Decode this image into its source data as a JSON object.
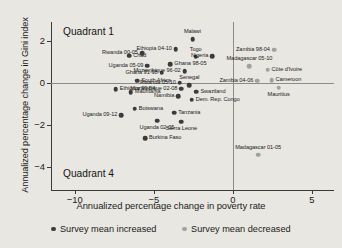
{
  "chart_data": {
    "type": "scatter",
    "title": "",
    "xlabel": "Annualized percentage change in poverty rate",
    "ylabel": "Annualized percentage change in Gini index",
    "xlim": [
      -11.5,
      6.4
    ],
    "ylim": [
      -5.1,
      2.9
    ],
    "xticks": [
      -10,
      -5,
      0,
      5
    ],
    "xtick_labels": [
      "−10",
      "−5",
      "0",
      "5"
    ],
    "yticks": [
      2,
      0,
      -2,
      -4
    ],
    "ytick_labels": [
      "2",
      "0",
      "−2",
      "−4"
    ],
    "grid": false,
    "zero_lines": {
      "x": 0,
      "y": 0
    },
    "annotations": [
      {
        "text": "Quadrant 1",
        "position": "upper-left"
      },
      {
        "text": "Quadrant 4",
        "position": "lower-left"
      }
    ],
    "legend": {
      "position": "below-axes",
      "entries": [
        {
          "label": "Survey mean increased",
          "color": "#3b3b3b",
          "key": "inc"
        },
        {
          "label": "Survey mean decreased",
          "color": "#a3a19d",
          "key": "dec"
        }
      ]
    },
    "series": [
      {
        "name": "Survey mean increased",
        "key": "inc",
        "color": "#3b3b3b",
        "points": [
          {
            "label": "Chad",
            "x": -6.55,
            "y": 1.3,
            "lblpos": "e"
          },
          {
            "label": "Rwanda 00-05",
            "x": -5.75,
            "y": 1.42,
            "lblpos": "w"
          },
          {
            "label": "Ethiopia 04-10",
            "x": -3.6,
            "y": 1.6,
            "lblpos": "w"
          },
          {
            "label": "Malawi",
            "x": -2.55,
            "y": 2.08,
            "lblpos": "n"
          },
          {
            "label": "Togo",
            "x": -2.35,
            "y": 1.24,
            "lblpos": "n"
          },
          {
            "label": "Nigeria",
            "x": -1.3,
            "y": 1.28,
            "lblpos": "w"
          },
          {
            "label": "Uganda 05-09",
            "x": -5.4,
            "y": 0.82,
            "lblpos": "w"
          },
          {
            "label": "Ghana 98-05",
            "x": -3.95,
            "y": 0.88,
            "lblpos": "e"
          },
          {
            "label": "Ghana 91-98",
            "x": -4.5,
            "y": 0.48,
            "lblpos": "w"
          },
          {
            "label": "Mozambique 96-02",
            "x": -3.05,
            "y": 0.55,
            "lblpos": "w"
          },
          {
            "label": "South Africa",
            "x": -6.05,
            "y": 0.1,
            "lblpos": "e"
          },
          {
            "label": "Rwanda 05-10",
            "x": -3.35,
            "y": 0.0,
            "lblpos": "w"
          },
          {
            "label": "Ethiopia 99-04",
            "x": -7.4,
            "y": -0.3,
            "lblpos": "e"
          },
          {
            "label": "Mauritania",
            "x": -6.45,
            "y": -0.45,
            "lblpos": "e"
          },
          {
            "label": "Mozambique 02-08",
            "x": -3.25,
            "y": -0.28,
            "lblpos": "w"
          },
          {
            "label": "Namibia",
            "x": -3.45,
            "y": -0.62,
            "lblpos": "w"
          },
          {
            "label": "Senegal",
            "x": -2.75,
            "y": -0.12,
            "lblpos": "n"
          },
          {
            "label": "Swaziland",
            "x": -2.3,
            "y": -0.42,
            "lblpos": "e"
          },
          {
            "label": "Dem. Rep. Congo",
            "x": -2.6,
            "y": -0.8,
            "lblpos": "e"
          },
          {
            "label": "Botswana",
            "x": -6.2,
            "y": -1.22,
            "lblpos": "e"
          },
          {
            "label": "Uganda 09-12",
            "x": -7.05,
            "y": -1.55,
            "lblpos": "w"
          },
          {
            "label": "Uganda 02-05",
            "x": -4.8,
            "y": -1.8,
            "lblpos": "s"
          },
          {
            "label": "Tanzania",
            "x": -3.7,
            "y": -1.42,
            "lblpos": "e"
          },
          {
            "label": "Sierra Leone",
            "x": -3.25,
            "y": -1.85,
            "lblpos": "s"
          },
          {
            "label": "Burkina Faso",
            "x": -5.55,
            "y": -2.62,
            "lblpos": "e"
          }
        ]
      },
      {
        "name": "Survey mean decreased",
        "key": "dec",
        "color": "#a3a19d",
        "points": [
          {
            "label": "Zambia 98-04",
            "x": 2.6,
            "y": 1.58,
            "lblpos": "w"
          },
          {
            "label": "Madagascar 05-10",
            "x": 1.05,
            "y": 0.8,
            "lblpos": "n"
          },
          {
            "label": "Côte d'Ivoire",
            "x": 2.2,
            "y": 0.62,
            "lblpos": "e"
          },
          {
            "label": "Zambia 04-06",
            "x": 1.55,
            "y": 0.1,
            "lblpos": "w"
          },
          {
            "label": "Cameroon",
            "x": 2.45,
            "y": 0.12,
            "lblpos": "e"
          },
          {
            "label": "Mauritius",
            "x": 2.9,
            "y": -0.22,
            "lblpos": "s"
          },
          {
            "label": "Madagascar 01-05",
            "x": 1.6,
            "y": -3.42,
            "lblpos": "n"
          }
        ]
      }
    ]
  }
}
